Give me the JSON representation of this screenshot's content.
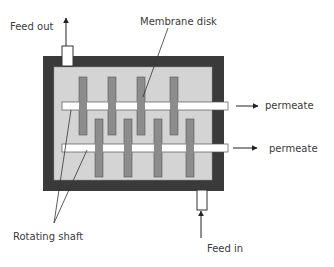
{
  "diagram": {
    "labels": {
      "feed_out": "Feed out",
      "membrane_disk": "Membrane disk",
      "permeate_top": "permeate",
      "permeate_bottom": "permeate",
      "rotating_shaft": "Rotating shaft",
      "feed_in": "Feed in"
    },
    "components": {
      "upper_shaft_disks": 4,
      "lower_shaft_disks": 4,
      "shafts": 2
    },
    "colors": {
      "housing": "#3a3a3a",
      "chamber": "#d4d4d4",
      "disk": "#8c8c8c",
      "shaft": "#ffffff",
      "line": "#333333"
    }
  }
}
